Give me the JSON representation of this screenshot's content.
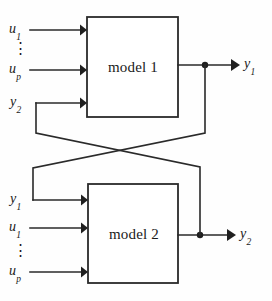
{
  "diagram": {
    "type": "block-diagram",
    "stroke_color": "#2a2a2a",
    "background_color": "#fefefe",
    "blocks": [
      {
        "id": "model1",
        "label": "model 1",
        "inputs": [
          "u_1",
          "u_p",
          "y_2"
        ],
        "outputs": [
          "y_1"
        ]
      },
      {
        "id": "model2",
        "label": "model 2",
        "inputs": [
          "y_1",
          "u_1",
          "u_p"
        ],
        "outputs": [
          "y_2"
        ]
      }
    ],
    "labels": {
      "model1_label": "model 1",
      "model2_label": "model 2",
      "u1_top": "u",
      "u1_top_sub": "1",
      "up_top": "u",
      "up_top_sub": "p",
      "y2_in": "y",
      "y2_in_sub": "2",
      "y1_out": "y",
      "y1_out_sub": "1",
      "y1_in": "y",
      "y1_in_sub": "1",
      "u1_bottom": "u",
      "u1_bottom_sub": "1",
      "up_bottom": "u",
      "up_bottom_sub": "p",
      "y2_out": "y",
      "y2_out_sub": "2",
      "vertical_dots_top": "⋮",
      "vertical_dots_bottom": "⋮"
    }
  }
}
